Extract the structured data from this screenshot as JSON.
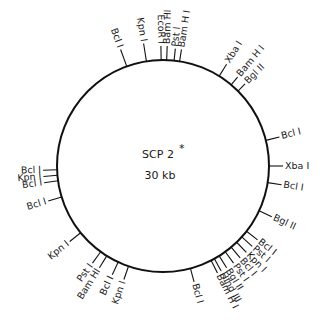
{
  "plasmid": {
    "name": "SCP 2",
    "marker": "*",
    "size": "30 kb",
    "center": [
      163,
      166
    ],
    "radius": 106,
    "stroke_color": "#111111",
    "stroke_width": 2
  },
  "sites": [
    {
      "label": "Bcl I",
      "angle": -20,
      "tick": 18,
      "rot": "radial"
    },
    {
      "label": "Kpn I",
      "angle": -9,
      "tick": 18,
      "rot": "radial"
    },
    {
      "label": "EcoR I",
      "angle": -1,
      "tick": 14,
      "rot": "radial"
    },
    {
      "label": "Bam HI",
      "angle": 2,
      "tick": 14,
      "rot": "radial"
    },
    {
      "label": "Pst I",
      "angle": 6,
      "tick": 12,
      "rot": "radial"
    },
    {
      "label": "Bam H I",
      "angle": 9,
      "tick": 12,
      "rot": "radial"
    },
    {
      "label": "Xba I",
      "angle": 32,
      "tick": 14,
      "rot": "radial"
    },
    {
      "label": "Bam H I",
      "angle": 40,
      "tick": 10,
      "rot": "radial"
    },
    {
      "label": "Bgl II",
      "angle": 45,
      "tick": 10,
      "rot": "radial"
    },
    {
      "label": "Bcl I",
      "angle": 76,
      "tick": 14,
      "rot": "radial"
    },
    {
      "label": "Xba I",
      "angle": 90,
      "tick": 14,
      "rot": "radial"
    },
    {
      "label": "Bcl I",
      "angle": 99,
      "tick": 14,
      "rot": "radial"
    },
    {
      "label": "Bgl II",
      "angle": 115,
      "tick": 14,
      "rot": "radial"
    },
    {
      "label": "Bcl I",
      "angle": 128,
      "tick": 14,
      "rot": "radial"
    },
    {
      "label": "Pst I",
      "angle": 132,
      "tick": 14,
      "rot": "radial"
    },
    {
      "label": "Kpn I",
      "angle": 136,
      "tick": 14,
      "rot": "radial"
    },
    {
      "label": "Bcl I",
      "angle": 140,
      "tick": 14,
      "rot": "radial"
    },
    {
      "label": "Pst I",
      "angle": 144,
      "tick": 14,
      "rot": "radial"
    },
    {
      "label": "Bgl II",
      "angle": 148,
      "tick": 14,
      "rot": "radial"
    },
    {
      "label": "Hind III",
      "angle": 151,
      "tick": 14,
      "rot": "radial"
    },
    {
      "label": "Bam H I",
      "angle": 153,
      "tick": 14,
      "rot": "radial"
    },
    {
      "label": "Bcl I",
      "angle": 165,
      "tick": 14,
      "rot": "radial"
    },
    {
      "label": "Kpn I",
      "angle": 199,
      "tick": 14,
      "rot": "radial"
    },
    {
      "label": "Bcl I",
      "angle": 205,
      "tick": 14,
      "rot": "radial"
    },
    {
      "label": "Bam HI",
      "angle": 212,
      "tick": 14,
      "rot": "radial"
    },
    {
      "label": "Pst I",
      "angle": 216,
      "tick": 14,
      "rot": "radial"
    },
    {
      "label": "Kpn I",
      "angle": 231,
      "tick": 14,
      "rot": "radial"
    },
    {
      "label": "Bcl I",
      "angle": 253,
      "tick": 14,
      "rot": "radial"
    },
    {
      "label": "Bcl I",
      "angle": 262,
      "tick": 14,
      "rot": "radial"
    },
    {
      "label": "Kpn I",
      "angle": 265,
      "tick": 14,
      "rot": "radial"
    },
    {
      "label": "Bcl I",
      "angle": 268,
      "tick": 14,
      "rot": "radial"
    }
  ]
}
